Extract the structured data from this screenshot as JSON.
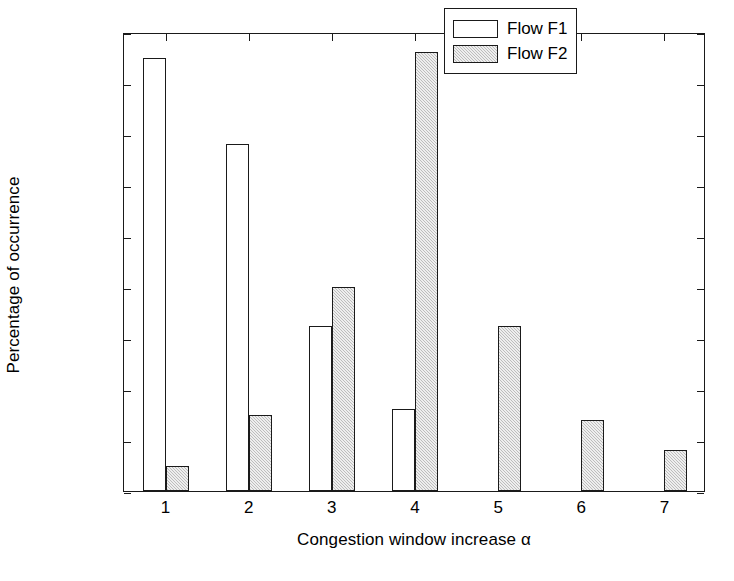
{
  "chart_data": {
    "type": "bar",
    "title": "",
    "subtitle": "",
    "xlabel": "Congestion window increase α",
    "ylabel": "Percentage of occurrence",
    "categories": [
      "1",
      "2",
      "3",
      "4",
      "5",
      "6",
      "7"
    ],
    "series": [
      {
        "name": "Flow F1",
        "fill": "white",
        "values": [
          0.425,
          0.34,
          0.162,
          0.08,
          0,
          0,
          0
        ]
      },
      {
        "name": "Flow F2",
        "fill": "gray-hatched",
        "values": [
          0.025,
          0.075,
          0.2,
          0.43,
          0.162,
          0.07,
          0.04
        ]
      }
    ],
    "ylim": [
      0,
      0.45
    ],
    "xlim": [
      0.5,
      7.5
    ],
    "ytick_labels": [
      "0",
      "0.05",
      "0.1",
      "0.15",
      "0.2",
      "0.25",
      "0.3",
      "0.35",
      "0.4",
      "0.45"
    ],
    "ytick_values": [
      0,
      0.05,
      0.1,
      0.15,
      0.2,
      0.25,
      0.3,
      0.35,
      0.4,
      0.45
    ],
    "xtick_labels": [
      "1",
      "2",
      "3",
      "4",
      "5",
      "6",
      "7"
    ],
    "xtick_values": [
      1,
      2,
      3,
      4,
      5,
      6,
      7
    ],
    "grid": false,
    "legend_position": "top-right",
    "colors": {
      "axis": "#1a1a1a",
      "background": "#ffffff",
      "series_f1": "#ffffff",
      "series_f2": "#bdbdbd"
    }
  },
  "legend": {
    "entries": [
      {
        "label": "Flow F1"
      },
      {
        "label": "Flow F2"
      }
    ]
  },
  "axes": {
    "x_title": "Congestion window increase α",
    "y_title": "Percentage of occurrence"
  }
}
